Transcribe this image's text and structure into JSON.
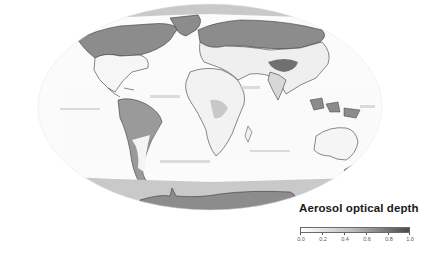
{
  "figure": {
    "projection": "mollweide-like ellipse",
    "background": "#ffffff"
  },
  "legend": {
    "title": "Aerosol optical depth",
    "colormap": {
      "low": "#ffffff",
      "high": "#4a4a4a"
    },
    "ticks": [
      "0.0",
      "0.2",
      "0.4",
      "0.6",
      "0.8",
      "1.0"
    ],
    "range": [
      0.0,
      1.0
    ]
  },
  "colors": {
    "land_outline": "#3a3a3a",
    "no_data_dark": "#8c8c8c",
    "no_data_light": "#c9c9c9",
    "ocean": "#fbfbfb"
  }
}
